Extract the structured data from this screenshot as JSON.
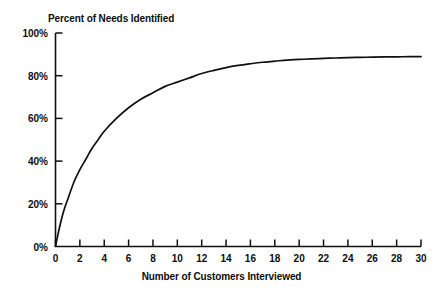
{
  "chart_data": {
    "type": "line",
    "title": "Percent of Needs Identified",
    "xlabel": "Number of Customers Interviewed",
    "ylabel": "",
    "xlim": [
      0,
      30
    ],
    "ylim": [
      0,
      100
    ],
    "grid": false,
    "legend": false,
    "line_color": "#101010",
    "background_color": "#ffffff",
    "axis_color": "#101010",
    "x_ticks": [
      0,
      2,
      4,
      6,
      8,
      10,
      12,
      14,
      16,
      18,
      20,
      22,
      24,
      26,
      28,
      30
    ],
    "x_tick_labels": [
      "0",
      "2",
      "4",
      "6",
      "8",
      "10",
      "12",
      "14",
      "16",
      "18",
      "20",
      "22",
      "24",
      "26",
      "28",
      "30"
    ],
    "y_ticks": [
      0,
      20,
      40,
      60,
      80,
      100
    ],
    "y_tick_labels": [
      "0%",
      "20%",
      "40%",
      "60%",
      "80%",
      "100%"
    ],
    "series": [
      {
        "name": "Percent of Needs Identified",
        "x": [
          0,
          0.25,
          0.5,
          0.75,
          1,
          1.5,
          2,
          2.5,
          3,
          3.5,
          4,
          5,
          6,
          7,
          8,
          9,
          10,
          11,
          12,
          13,
          14,
          15,
          16,
          17,
          18,
          19,
          20,
          21,
          22,
          23,
          24,
          25,
          26,
          27,
          28,
          29,
          30
        ],
        "values": [
          0,
          7,
          13,
          18,
          22,
          30,
          36,
          41,
          46,
          50,
          54,
          60,
          65,
          69,
          72,
          75,
          77,
          79,
          81,
          82.5,
          83.8,
          84.8,
          85.6,
          86.3,
          86.8,
          87.3,
          87.6,
          87.9,
          88.1,
          88.3,
          88.5,
          88.6,
          88.7,
          88.8,
          88.85,
          88.9,
          88.95
        ]
      }
    ]
  }
}
